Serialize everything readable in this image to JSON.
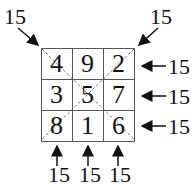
{
  "diagram": {
    "grid": [
      [
        "4",
        "9",
        "2"
      ],
      [
        "3",
        "5",
        "7"
      ],
      [
        "8",
        "1",
        "6"
      ]
    ],
    "diagonal_sums": {
      "top_left": "15",
      "top_right": "15"
    },
    "row_sums": [
      "15",
      "15",
      "15"
    ],
    "column_sums": [
      "15",
      "15",
      "15"
    ]
  }
}
